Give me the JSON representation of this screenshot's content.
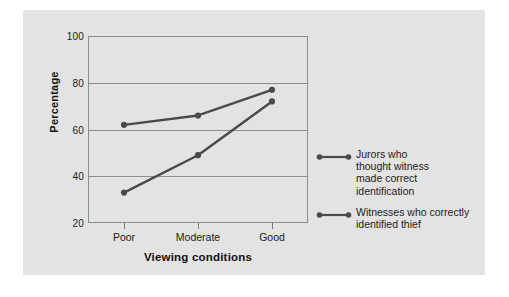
{
  "figure": {
    "background_color": "#ffffff",
    "panel_color": "#e3e3e3",
    "line_color": "#4a4a4a",
    "axis_color": "#8d8d8d"
  },
  "chart_data": {
    "type": "line",
    "title": "",
    "xlabel": "Viewing conditions",
    "ylabel": "Percentage",
    "categories": [
      "Poor",
      "Moderate",
      "Good"
    ],
    "ylim": [
      20,
      100
    ],
    "yticks": [
      20,
      40,
      60,
      80,
      100
    ],
    "grid": true,
    "legend_position": "right",
    "series": [
      {
        "name": "Jurors who thought witness made correct identification",
        "values": [
          62,
          66,
          77
        ],
        "color": "#4a4a4a"
      },
      {
        "name": "Witnesses who correctly identified thief",
        "values": [
          33,
          49,
          72
        ],
        "color": "#4a4a4a"
      }
    ]
  },
  "axis": {
    "y_tick_labels": [
      "100",
      "80",
      "60",
      "40",
      "20"
    ],
    "y_title": "Percentage",
    "x_tick_labels": [
      "Poor",
      "Moderate",
      "Good"
    ],
    "x_title": "Viewing conditions"
  },
  "legend": {
    "entries": [
      {
        "lines": [
          "Jurors who",
          "thought witness",
          "made correct",
          "identification"
        ]
      },
      {
        "lines": [
          "Witnesses who correctly",
          "identified thief"
        ]
      }
    ]
  }
}
